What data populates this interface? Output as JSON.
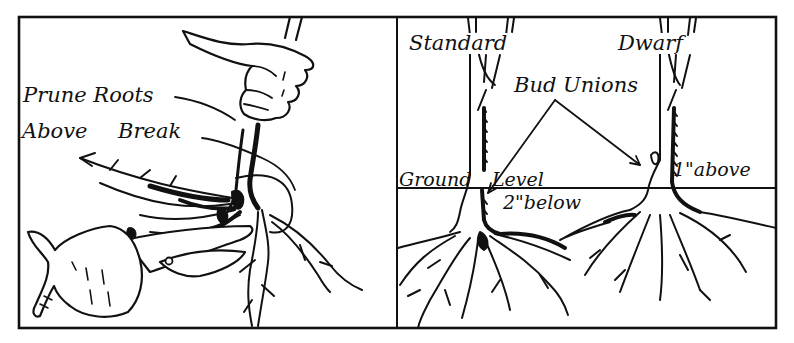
{
  "figure": {
    "colors": {
      "ink": "#111111",
      "paper": "#ffffff"
    },
    "left_panel": {
      "title": "Pruning roots",
      "labels": {
        "line1": "Prune Roots",
        "line2_a": "Above",
        "line2_b": "Break"
      },
      "elements": [
        "hand-holding-stem",
        "pruning-shears",
        "hand-holding-shears",
        "root-mass"
      ]
    },
    "right_panel": {
      "trees": {
        "standard": {
          "label": "Standard",
          "bud_union_position": "2\" below"
        },
        "dwarf": {
          "label": "Dwarf",
          "bud_union_position": "1\" above"
        }
      },
      "labels": {
        "bud_unions": "Bud Unions",
        "ground_level_a": "Ground",
        "ground_level_b": "Level",
        "below": "2\"below",
        "above": "1\"above"
      }
    }
  }
}
